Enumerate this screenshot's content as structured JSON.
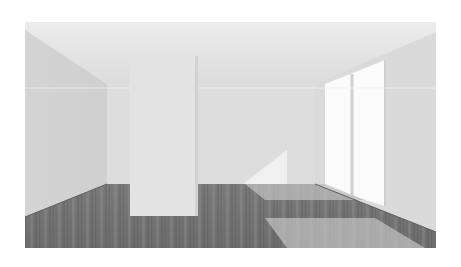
{
  "image": {
    "description": "Grayscale 3D render of an empty room with white walls, a central pillar, a sliding glass door on the right, and dark wood plank flooring with sunlight patches",
    "colors": {
      "ceiling": "#e9e9e9",
      "back_wall": "#dedede",
      "left_wall": "#d6d6d6",
      "right_wall": "#dcdcdc",
      "pillar": "#e2e2e2",
      "window_light": "#fafafa",
      "floor_dark": "#6a6a6a",
      "floor_mid": "#858585",
      "floor_light": "#c4c4c4"
    }
  }
}
